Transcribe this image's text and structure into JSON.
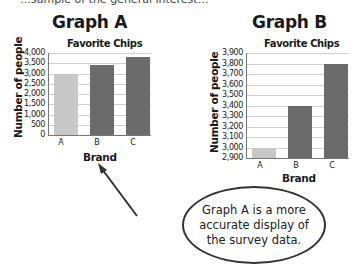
{
  "top_text": "…sample of the general interest…",
  "graph_a": {
    "heading": "Graph A"
  },
  "graph_b": {
    "heading": "Graph B"
  },
  "callout": {
    "text": "Graph A is a more accurate display of the survey data."
  },
  "colors": {
    "bar_a": "#c8c8c8",
    "bar_b": "#6b6b6b",
    "bar_c": "#6b6b6b",
    "grid": "#cfcfcf"
  },
  "chart_data": [
    {
      "type": "bar",
      "panel": "Graph A",
      "title": "Favorite Chips",
      "xlabel": "Brand",
      "ylabel": "Number of people",
      "categories": [
        "A",
        "B",
        "C"
      ],
      "values": [
        3000,
        3400,
        3800
      ],
      "ylim": [
        0,
        4000
      ],
      "yticks": [
        "0",
        "500",
        "1,000",
        "1,500",
        "2,000",
        "2,500",
        "3,000",
        "3,500",
        "4,000"
      ],
      "grid": true
    },
    {
      "type": "bar",
      "panel": "Graph B",
      "title": "Favorite Chips",
      "xlabel": "Brand",
      "ylabel": "Number of people",
      "categories": [
        "A",
        "B",
        "C"
      ],
      "values": [
        3000,
        3400,
        3800
      ],
      "ylim": [
        2900,
        3900
      ],
      "yticks": [
        "2,900",
        "3,000",
        "3,100",
        "3,200",
        "3,300",
        "3,400",
        "3,500",
        "3,600",
        "3,700",
        "3,800",
        "3,900"
      ],
      "grid": true
    }
  ]
}
